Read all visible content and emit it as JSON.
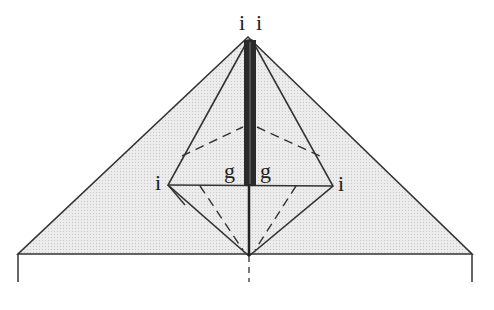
{
  "diagram": {
    "type": "origami-fold-diagram",
    "labels": {
      "top_left": "i",
      "top_right": "i",
      "mid_left": "i",
      "mid_right": "i",
      "center_left": "g",
      "center_right": "g"
    },
    "colors": {
      "fill": "#e6e6e6",
      "line": "#333333",
      "spine": "#2a2a2a"
    }
  }
}
